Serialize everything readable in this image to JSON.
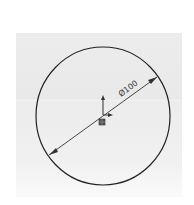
{
  "diagram": {
    "type": "cad-sketch",
    "shape": "circle",
    "dimension": {
      "label": "Ø100",
      "kind": "diameter"
    },
    "origin": {
      "icon": "origin-axes-icon"
    },
    "colors": {
      "background": "#ffffff",
      "panel": "#ececec",
      "stroke": "#222222",
      "dimension": "#333333"
    }
  }
}
